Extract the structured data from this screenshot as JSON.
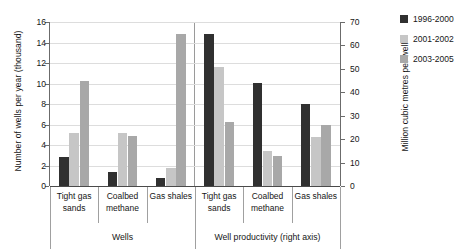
{
  "chart_data": {
    "type": "bar",
    "title": "",
    "subtitle": "",
    "categories": [
      "Tight gas sands",
      "Coalbed methane",
      "Gas shales"
    ],
    "panels": [
      {
        "name": "Wells",
        "label": "Wells",
        "axis": "left",
        "series": [
          {
            "name": "1996-2000",
            "values": [
              2.8,
              1.4,
              0.75
            ]
          },
          {
            "name": "2001-2002",
            "values": [
              5.2,
              5.15,
              1.75
            ]
          },
          {
            "name": "2003-2005",
            "values": [
              10.25,
              4.9,
              14.85
            ]
          }
        ]
      },
      {
        "name": "Well productivity",
        "label": "Well productivity (right axis)",
        "axis": "right",
        "series": [
          {
            "name": "1996-2000",
            "values": [
              65,
              44,
              35
            ]
          },
          {
            "name": "2001-2002",
            "values": [
              51,
              15,
              21
            ]
          },
          {
            "name": "2003-2005",
            "values": [
              27.5,
              13,
              26
            ]
          }
        ]
      }
    ],
    "ylabel": "Number of wells per year (thousand)",
    "ylabel_right": "Million cubic metres per well",
    "xlabel": "",
    "ylim": [
      0,
      16
    ],
    "ylim_right": [
      0,
      70
    ],
    "yticks": [
      "0",
      "2",
      "4",
      "6",
      "8",
      "10",
      "12",
      "14",
      "16"
    ],
    "yticks_right": [
      "0",
      "10",
      "20",
      "30",
      "40",
      "50",
      "60",
      "70"
    ],
    "grid": true,
    "legend_position": "right",
    "legend": [
      {
        "label": "1996-2000",
        "color": "#303030"
      },
      {
        "label": "2001-2002",
        "color": "#c6c6c6"
      },
      {
        "label": "2003-2005",
        "color": "#a8a8a8"
      }
    ]
  }
}
